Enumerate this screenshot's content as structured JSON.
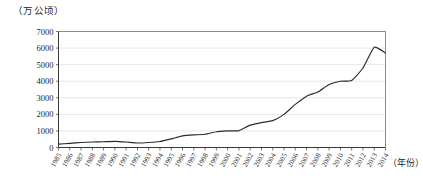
{
  "chart_data": {
    "type": "line",
    "title": "",
    "subtitle": "",
    "xlabel": "（年份）",
    "ylabel": "（万公顷）",
    "ylim": [
      0,
      7000
    ],
    "ytick_labels": [
      "0",
      "1000",
      "2000",
      "3000",
      "4000",
      "5000",
      "6000",
      "7000"
    ],
    "yticks": [
      0,
      1000,
      2000,
      3000,
      4000,
      5000,
      6000,
      7000
    ],
    "grid": true,
    "legend": null,
    "categories": [
      "1985",
      "1986",
      "1987",
      "1988",
      "1989",
      "1990",
      "1991",
      "1992",
      "1993",
      "1994",
      "1995",
      "1996",
      "1997",
      "1998",
      "1999",
      "2000",
      "2001",
      "2002",
      "2003",
      "2004",
      "2005",
      "2006",
      "2007",
      "2008",
      "2009",
      "2010",
      "2011",
      "2012",
      "2013",
      "2014"
    ],
    "x": [
      1985,
      1986,
      1987,
      1988,
      1989,
      1990,
      1991,
      1992,
      1993,
      1994,
      1995,
      1996,
      1997,
      1998,
      1999,
      2000,
      2001,
      2002,
      2003,
      2004,
      2005,
      2006,
      2007,
      2008,
      2009,
      2010,
      2011,
      2012,
      2013,
      2014
    ],
    "values": [
      200,
      250,
      300,
      330,
      350,
      370,
      330,
      270,
      300,
      360,
      520,
      700,
      760,
      800,
      950,
      1000,
      1020,
      1350,
      1500,
      1620,
      2000,
      2600,
      3100,
      3350,
      3800,
      4000,
      4050,
      4800,
      6050,
      5700
    ],
    "series": [
      {
        "name": "",
        "values": [
          200,
          250,
          300,
          330,
          350,
          370,
          330,
          270,
          300,
          360,
          520,
          700,
          760,
          800,
          950,
          1000,
          1020,
          1350,
          1500,
          1620,
          2000,
          2600,
          3100,
          3350,
          3800,
          4000,
          4050,
          4800,
          6050,
          5700
        ],
        "color": "#2b2b2b"
      }
    ]
  },
  "colors": {
    "line": "#2b2b2b",
    "grid": "#d9d9d9",
    "axis": "#3a3a3a",
    "frame": "#6e6e6e",
    "background": "#ffffff"
  }
}
